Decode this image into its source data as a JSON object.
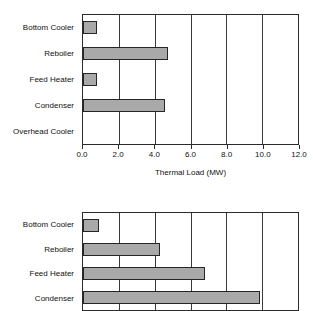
{
  "chart_data": [
    {
      "type": "bar",
      "orientation": "horizontal",
      "position": "top",
      "title": "",
      "xlabel": "Thermal Load (MW)",
      "ylabel": "",
      "xlim": [
        0.0,
        12.0
      ],
      "xticks": [
        "0.0",
        "2.0",
        "4.0",
        "6.0",
        "8.0",
        "10.0",
        "12.0"
      ],
      "xtick_values": [
        0.0,
        2.0,
        4.0,
        6.0,
        8.0,
        10.0,
        12.0
      ],
      "grid": "vertical",
      "legend": "none",
      "categories": [
        "Bottom Cooler",
        "Reboiler",
        "Feed Heater",
        "Condenser",
        "Overhead Cooler"
      ],
      "values": [
        0.8,
        4.75,
        0.8,
        4.6,
        0.0
      ],
      "bar_color": "#a9a9a9",
      "bar_edge_color": "#262626"
    },
    {
      "type": "bar",
      "orientation": "horizontal",
      "position": "bottom",
      "title": "",
      "xlabel": "",
      "ylabel": "",
      "xlim": [
        0.0,
        12.0
      ],
      "xticks": [
        "0.0",
        "2.0",
        "4.0",
        "6.0",
        "8.0",
        "10.0",
        "12.0"
      ],
      "xtick_values": [
        0.0,
        2.0,
        4.0,
        6.0,
        8.0,
        10.0,
        12.0
      ],
      "grid": "vertical",
      "legend": "none",
      "categories": [
        "Bottom Cooler",
        "Reboiler",
        "Feed Heater",
        "Condenser"
      ],
      "values": [
        0.9,
        4.3,
        6.8,
        9.9
      ],
      "bar_color": "#a9a9a9",
      "bar_edge_color": "#262626"
    }
  ],
  "top_chart": {
    "axis_title": "Thermal Load (MW)",
    "ticks": [
      "0.0",
      "2.0",
      "4.0",
      "6.0",
      "8.0",
      "10.0",
      "12.0"
    ],
    "categories": [
      {
        "label": "Bottom Cooler",
        "value": 0.8
      },
      {
        "label": "Reboiler",
        "value": 4.75
      },
      {
        "label": "Feed Heater",
        "value": 0.8
      },
      {
        "label": "Condenser",
        "value": 4.6
      },
      {
        "label": "Overhead Cooler",
        "value": 0.0
      }
    ]
  },
  "bottom_chart": {
    "axis_title": "",
    "ticks": [
      "0.0",
      "2.0",
      "4.0",
      "6.0",
      "8.0",
      "10.0",
      "12.0"
    ],
    "categories": [
      {
        "label": "Bottom Cooler",
        "value": 0.9
      },
      {
        "label": "Reboiler",
        "value": 4.3
      },
      {
        "label": "Feed Heater",
        "value": 6.8
      },
      {
        "label": "Condenser",
        "value": 9.9
      }
    ]
  }
}
